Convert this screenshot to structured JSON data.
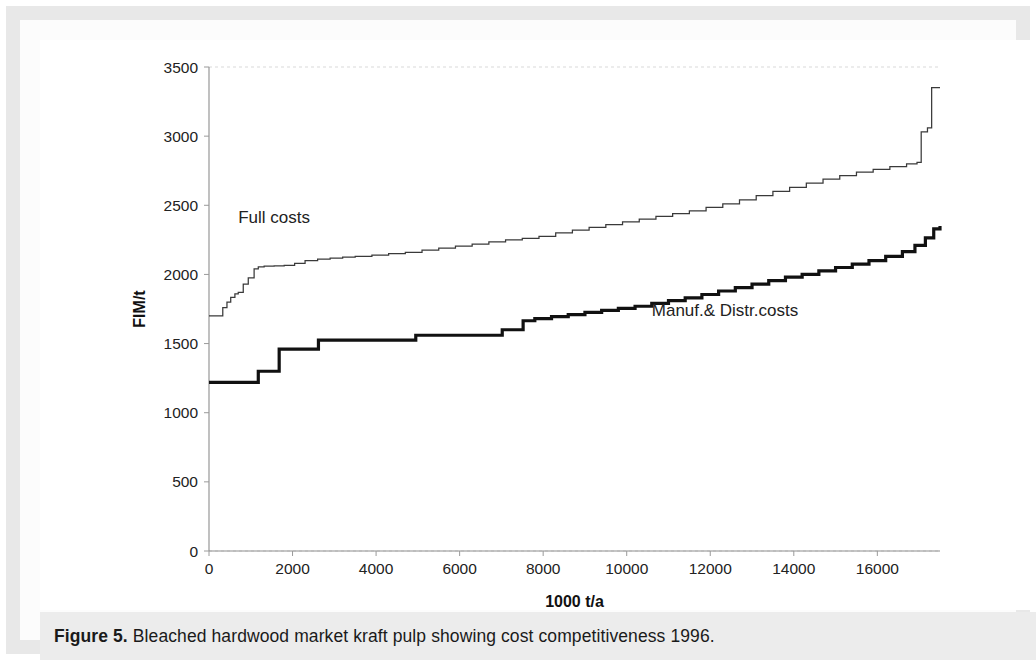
{
  "figure": {
    "caption_prefix": "Figure 5.",
    "caption_rest": " Bleached hardwood market kraft pulp showing cost competitiveness 1996."
  },
  "chart_data": {
    "type": "line",
    "title": "",
    "subtitle": "",
    "xlabel": "1000 t/a",
    "ylabel": "FIM/t",
    "xlim": [
      0,
      17500
    ],
    "ylim": [
      0,
      3500
    ],
    "xticks": [
      0,
      2000,
      4000,
      6000,
      8000,
      10000,
      12000,
      14000,
      16000
    ],
    "yticks": [
      0,
      500,
      1000,
      1500,
      2000,
      2500,
      3000,
      3500
    ],
    "grid": false,
    "legend_position": "inline-annotations",
    "step_style": "post",
    "annotations": [
      {
        "text": "Full costs",
        "x": 700,
        "y": 2370
      },
      {
        "text": "Manuf.& Distr.costs",
        "x": 10600,
        "y": 1700
      }
    ],
    "series": [
      {
        "name": "Full costs",
        "style": "thin",
        "color": "#3a3a3a",
        "x": [
          0,
          250,
          330,
          430,
          520,
          620,
          700,
          820,
          940,
          1080,
          1180,
          1320,
          1560,
          1800,
          2050,
          2300,
          2600,
          2900,
          3200,
          3500,
          3900,
          4300,
          4700,
          5100,
          5500,
          5900,
          6300,
          6700,
          7100,
          7500,
          7900,
          8300,
          8700,
          9100,
          9500,
          9900,
          10300,
          10700,
          11100,
          11500,
          11900,
          12300,
          12700,
          13100,
          13500,
          13900,
          14300,
          14700,
          15100,
          15500,
          15900,
          16300,
          16700,
          16950,
          17050,
          17200,
          17300,
          17500
        ],
        "y": [
          1700,
          1700,
          1760,
          1800,
          1835,
          1860,
          1870,
          1930,
          1975,
          2040,
          2055,
          2060,
          2062,
          2065,
          2080,
          2100,
          2110,
          2118,
          2125,
          2130,
          2140,
          2150,
          2160,
          2175,
          2190,
          2205,
          2220,
          2235,
          2250,
          2260,
          2275,
          2300,
          2320,
          2340,
          2360,
          2380,
          2400,
          2420,
          2440,
          2460,
          2485,
          2510,
          2540,
          2570,
          2600,
          2630,
          2660,
          2690,
          2715,
          2740,
          2760,
          2780,
          2800,
          2810,
          3030,
          3060,
          3350,
          3350
        ]
      },
      {
        "name": "Manuf.& Distr.costs",
        "style": "thick",
        "color": "#111111",
        "x": [
          0,
          1080,
          1180,
          1560,
          1680,
          2500,
          2620,
          4820,
          4950,
          6900,
          7020,
          7400,
          7520,
          7800,
          8200,
          8600,
          9000,
          9400,
          9800,
          10200,
          10600,
          11000,
          11400,
          11800,
          12200,
          12600,
          13000,
          13400,
          13800,
          14200,
          14600,
          15000,
          15400,
          15800,
          16200,
          16600,
          16900,
          17150,
          17350,
          17500
        ],
        "y": [
          1220,
          1220,
          1300,
          1300,
          1460,
          1460,
          1525,
          1525,
          1560,
          1560,
          1600,
          1600,
          1665,
          1680,
          1695,
          1710,
          1725,
          1740,
          1755,
          1770,
          1790,
          1810,
          1830,
          1855,
          1880,
          1905,
          1930,
          1955,
          1980,
          2000,
          2025,
          2050,
          2075,
          2100,
          2130,
          2165,
          2210,
          2265,
          2330,
          2350
        ]
      }
    ]
  }
}
